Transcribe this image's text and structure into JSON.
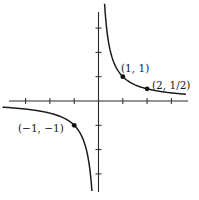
{
  "chart_data": {
    "type": "line",
    "title": "",
    "xlabel": "",
    "ylabel": "",
    "function": "y = 1/x",
    "xlim": [
      -4,
      4
    ],
    "ylim": [
      -4,
      4
    ],
    "grid": false,
    "x_ticks": [
      -3,
      -2,
      -1,
      1,
      2,
      3
    ],
    "y_ticks": [
      -3,
      -2,
      -1,
      1,
      2,
      3
    ],
    "series": [
      {
        "name": "y = 1/x (x > 0)",
        "x": [
          0.25,
          0.333,
          0.5,
          1,
          2,
          3,
          3.6
        ],
        "y": [
          4,
          3,
          2,
          1,
          0.5,
          0.333,
          0.278
        ]
      },
      {
        "name": "y = 1/x (x < 0)",
        "x": [
          -3.95,
          -3,
          -2,
          -1,
          -0.5,
          -0.333,
          -0.27
        ],
        "y": [
          -0.253,
          -0.333,
          -0.5,
          -1,
          -2,
          -3,
          -3.7
        ]
      }
    ],
    "points": [
      {
        "x": 1,
        "y": 1,
        "label": "(1, 1)"
      },
      {
        "x": 2,
        "y": 0.5,
        "label": "(2, 1/2)"
      },
      {
        "x": -1,
        "y": -1,
        "label": "(−1, −1)"
      }
    ],
    "style": {
      "line_color": "#1c1c1c",
      "axis_color": "#2a2a2a",
      "point_color": "#111111"
    }
  },
  "labels": {
    "p1": "(1, 1)",
    "p2": "(2, 1/2)",
    "p3": "(−1, −1)"
  }
}
